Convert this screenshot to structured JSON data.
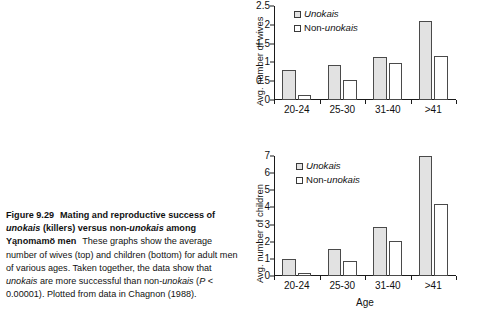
{
  "figure": {
    "number": "Figure 9.29",
    "title_part1": "Mating and reproductive success of ",
    "title_italic1": "unokais",
    "title_part2": " (killers) versus non-",
    "title_italic2": "unokais",
    "title_part3": " among Yąnomamö men",
    "body_part1": "These graphs show the average number of wives (top) and children (bottom) for adult men of various ages. Taken together, the data show that ",
    "body_italic1": "unokais",
    "body_part2": " are more successful than non-",
    "body_italic2": "unokais",
    "body_part3": " (",
    "body_italic3": "P",
    "body_part4": " < 0.00001). Plotted from data in Chagnon (1988)."
  },
  "legend": {
    "series1_label": "Unokais",
    "series2_prefix": "Non-",
    "series2_italic": "unokais",
    "series1_color": "#e2e2e2",
    "series2_color": "#ffffff",
    "border_color": "#4a4a4a"
  },
  "chart_data": [
    {
      "type": "bar",
      "id": "wives",
      "title": "",
      "xlabel": "",
      "ylabel": "Avg. number of wives",
      "categories": [
        "20-24",
        "25-30",
        "31-40",
        ">41"
      ],
      "ylim": [
        0,
        2.5
      ],
      "yticks": [
        0,
        0.5,
        1,
        1.5,
        2,
        2.5
      ],
      "ytick_labels": [
        "0",
        "0.5",
        "1",
        "1.5",
        "2",
        "2.5"
      ],
      "grid": false,
      "legend_position": "top-left",
      "series": [
        {
          "name": "Unokais",
          "values": [
            0.81,
            0.93,
            1.14,
            2.09
          ]
        },
        {
          "name": "Non-unokais",
          "values": [
            0.14,
            0.54,
            0.98,
            1.18
          ]
        }
      ]
    },
    {
      "type": "bar",
      "id": "children",
      "title": "",
      "xlabel": "Age",
      "ylabel": "Avg. number of children",
      "categories": [
        "20-24",
        "25-30",
        "31-40",
        ">41"
      ],
      "ylim": [
        0,
        7
      ],
      "yticks": [
        0,
        1,
        2,
        3,
        4,
        5,
        6,
        7
      ],
      "ytick_labels": [
        "0",
        "1",
        "2",
        "3",
        "4",
        "5",
        "6",
        "7"
      ],
      "grid": false,
      "legend_position": "top-left",
      "series": [
        {
          "name": "Unokais",
          "values": [
            1.0,
            1.6,
            2.87,
            7.0
          ]
        },
        {
          "name": "Non-unokais",
          "values": [
            0.18,
            0.9,
            2.05,
            4.2
          ]
        }
      ]
    }
  ]
}
